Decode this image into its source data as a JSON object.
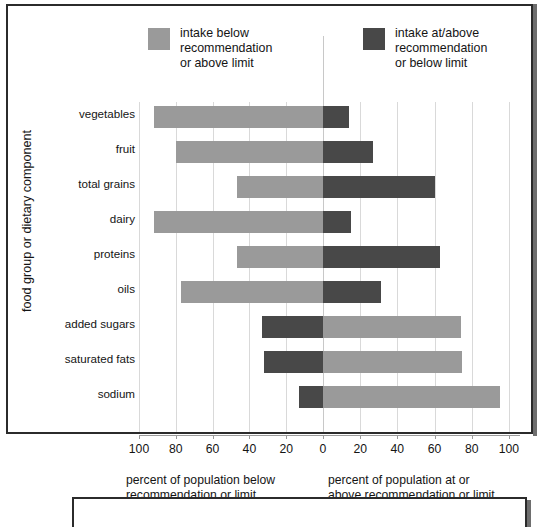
{
  "chart_data": {
    "type": "bar",
    "title": "",
    "subtitle": "",
    "orientation": "horizontal-diverging",
    "categories": [
      "vegetables",
      "fruit",
      "total grains",
      "dairy",
      "proteins",
      "oils",
      "added sugars",
      "saturated fats",
      "sodium"
    ],
    "series": [
      {
        "name": "intake below recommendation or above limit",
        "color": "#9a9a9a",
        "side_by_category": [
          "left",
          "left",
          "left",
          "left",
          "left",
          "left",
          "right",
          "right",
          "right"
        ],
        "values": [
          92,
          80,
          47,
          92,
          47,
          77,
          74,
          75,
          95
        ]
      },
      {
        "name": "intake at/above recommendation or below limit",
        "color": "#484848",
        "side_by_category": [
          "right",
          "right",
          "right",
          "right",
          "right",
          "right",
          "left",
          "left",
          "left"
        ],
        "values": [
          14,
          27,
          60,
          15,
          63,
          31,
          33,
          32,
          13
        ]
      }
    ],
    "xlabel": "percent of population",
    "ylabel": "food group or dietary component",
    "xlim_left": [
      100,
      0
    ],
    "xlim_right": [
      0,
      100
    ],
    "xticks": [
      100,
      80,
      60,
      40,
      20,
      0,
      20,
      40,
      60,
      80,
      100
    ],
    "grid": true,
    "legend_position": "top"
  },
  "legend": {
    "items": [
      {
        "label": "intake below\nrecommendation\nor above limit",
        "color": "#9a9a9a",
        "swatch_name": "legend-swatch-below"
      },
      {
        "label": "intake at/above\nrecommendation\nor below limit",
        "color": "#484848",
        "swatch_name": "legend-swatch-atabove"
      }
    ]
  },
  "axes": {
    "y_title": "food group or dietary component",
    "y_categories": [
      "vegetables",
      "fruit",
      "total grains",
      "dairy",
      "proteins",
      "oils",
      "added sugars",
      "saturated fats",
      "sodium"
    ],
    "x_ticklabels": [
      "100",
      "80",
      "60",
      "40",
      "20",
      "0",
      "20",
      "40",
      "60",
      "80",
      "100"
    ],
    "x_caption_left": "percent of population below\nrecommendation or limit",
    "x_caption_right": "percent of population at or\nabove recommendation or limit"
  }
}
